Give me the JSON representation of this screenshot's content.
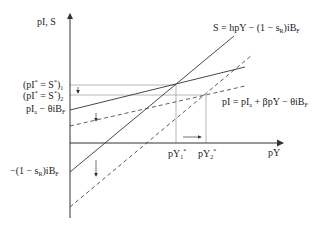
{
  "axes": {
    "y_label": "pI, S",
    "x_label": "pY"
  },
  "curves": {
    "saving": "S = hpY − (1 − s_R)iB_F",
    "investment": "pI = pI_a + βpY − θiB_F"
  },
  "y_ticks": {
    "eq1": "(pI* = S*)₁",
    "eq2": "(pI* = S*)₂",
    "inv_intercept": "pI_a − θiB_F",
    "sav_intercept": "−(1 − s_R)iB_F"
  },
  "x_ticks": {
    "y1": "pY₁*",
    "y2": "pY₂*"
  },
  "labels": {
    "S_eq": "S = hpY − (1 − s",
    "S_sub": "R",
    "S_tail": ")iB",
    "S_sub2": "F",
    "I_eq": "pI = pI",
    "I_sub": "a",
    "I_mid": " + βpY − θiB",
    "I_sub2": "F",
    "eq1_main": "(pI",
    "eq1_star": "*",
    "eq1_mid": " = S",
    "eq1_star2": "*",
    "eq1_close": ")",
    "eq1_sub": "1",
    "eq2_sub": "2",
    "inv_a": "pI",
    "inv_sub": "a",
    "inv_rest": " − θiB",
    "inv_sub2": "F",
    "sav_main": "−(1 − s",
    "sav_sub": "R",
    "sav_rest": ")iB",
    "sav_sub2": "F",
    "py": "pY",
    "py1_sub": "1",
    "py2_sub": "2",
    "star": "*"
  },
  "colors": {
    "line": "#333333",
    "ref": "#999999"
  }
}
